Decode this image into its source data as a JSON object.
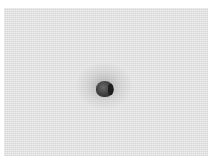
{
  "image": {
    "subject": "textured gray surface with a small dark spot",
    "colors": {
      "background": "#ffffff",
      "surface": "#e6e6e6",
      "spot": "#3c3c3c"
    }
  }
}
